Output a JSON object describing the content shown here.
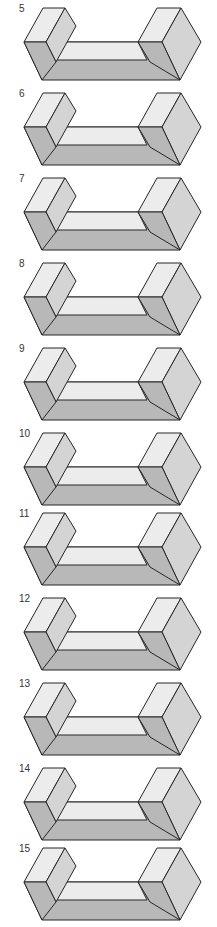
{
  "figures": [
    {
      "label": "5",
      "top": 0
    },
    {
      "label": "6",
      "top": 85
    },
    {
      "label": "7",
      "top": 170
    },
    {
      "label": "8",
      "top": 255
    },
    {
      "label": "9",
      "top": 340
    },
    {
      "label": "10",
      "top": 425
    },
    {
      "label": "11",
      "top": 505
    },
    {
      "label": "12",
      "top": 590
    },
    {
      "label": "13",
      "top": 675
    },
    {
      "label": "14",
      "top": 760
    },
    {
      "label": "15",
      "top": 840
    }
  ],
  "colors": {
    "top_face": "#ececec",
    "side_face": "#d4d4d4",
    "front_face": "#b8b8b8",
    "outline": "#262626",
    "background": "#ffffff"
  }
}
